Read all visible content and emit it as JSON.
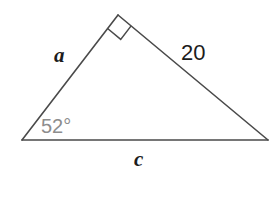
{
  "figure": {
    "type": "right-triangle-diagram",
    "background_color": "#ffffff",
    "stroke_color": "#4a4a4a",
    "stroke_width": 1.6,
    "vertices": {
      "left": {
        "x": 22,
        "y": 140
      },
      "apex": {
        "x": 118,
        "y": 15
      },
      "right": {
        "x": 268,
        "y": 140
      }
    },
    "right_angle_marker": {
      "at_vertex": "apex",
      "name": "right-angle-square",
      "size": 17,
      "color": "#4a4a4a"
    },
    "labels": {
      "side_a": {
        "text": "a",
        "color": "#1c1c1c",
        "style": "italic",
        "describes": "left-side"
      },
      "side_b": {
        "text": "20",
        "color": "#1c1c1c",
        "style": "normal",
        "describes": "right-side"
      },
      "side_c": {
        "text": "c",
        "color": "#1c1c1c",
        "style": "italic",
        "describes": "base-side"
      },
      "angle": {
        "text": "52°",
        "color": "#8d8d8d",
        "style": "normal",
        "describes": "left-vertex-angle"
      }
    }
  }
}
